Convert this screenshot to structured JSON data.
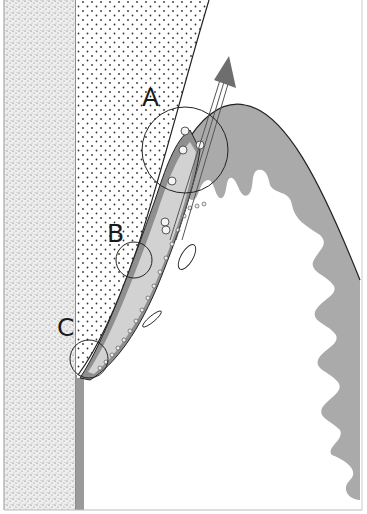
{
  "figure": {
    "type": "anatomical-schematic",
    "labels": [
      {
        "id": "A",
        "text": "A",
        "x": 142,
        "y": 106
      },
      {
        "id": "B",
        "text": "B",
        "x": 107,
        "y": 242
      },
      {
        "id": "C",
        "text": "C",
        "x": 57,
        "y": 336
      }
    ],
    "colors": {
      "background": "#ffffff",
      "stipple_region": "#f0f0f0",
      "dotted_region": "#ffffff",
      "gray_tissue": "#a9a9a9",
      "light_band": "#d4d4d4",
      "arrow": "#6e6e6e",
      "line": "#222222"
    }
  }
}
